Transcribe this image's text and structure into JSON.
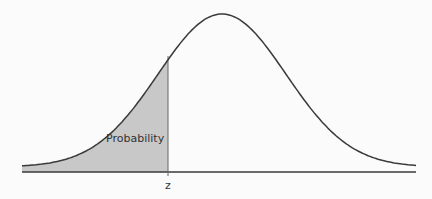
{
  "diagram": {
    "type": "normal-distribution-left-tail",
    "region_label": "Probability",
    "axis_marker_label": "z",
    "colors": {
      "curve": "#3a3a3a",
      "shade": "#c8c8c8",
      "axis": "#3a3a3a",
      "background": "#fbfbfb"
    }
  }
}
